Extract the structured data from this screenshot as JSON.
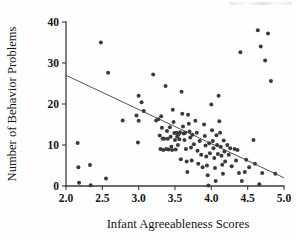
{
  "figure": {
    "type": "scatterplot",
    "caption": ""
  },
  "axes": {
    "x": {
      "title": "Infant Agreeableness Scores",
      "ticks": [
        "2.0",
        "2.5",
        "3.0",
        "3.5",
        "4.0",
        "4.5",
        "5.0"
      ],
      "min": 2.0,
      "max": 5.0
    },
    "y": {
      "title": "Number of Behavior Problems",
      "ticks": [
        "0",
        "10",
        "20",
        "30",
        "40"
      ],
      "min": 0,
      "max": 40
    }
  },
  "chart_data": {
    "type": "scatter",
    "title": "",
    "xlabel": "Infant Agreeableness Scores",
    "ylabel": "Number of Behavior Problems",
    "xlim": [
      2.0,
      5.0
    ],
    "ylim": [
      0,
      40
    ],
    "xticks": [
      2.0,
      2.5,
      3.0,
      3.5,
      4.0,
      4.5,
      5.0
    ],
    "yticks": [
      0,
      10,
      20,
      30,
      40
    ],
    "grid": false,
    "legend": null,
    "point_color": "#3b3b3f",
    "line_color": "#4a4a4a",
    "trend_line": {
      "type": "linear-regression",
      "x_start": 2.0,
      "y_start": 27.0,
      "x_end": 5.0,
      "y_end": 2.0,
      "slope": -8.33,
      "intercept": 43.67
    },
    "points": [
      [
        2.16,
        10.5
      ],
      [
        2.17,
        4.6
      ],
      [
        2.18,
        0.8
      ],
      [
        2.33,
        5.1
      ],
      [
        2.34,
        0.2
      ],
      [
        2.48,
        35.0
      ],
      [
        2.55,
        1.8
      ],
      [
        2.58,
        27.6
      ],
      [
        2.78,
        16.0
      ],
      [
        2.97,
        17.2
      ],
      [
        2.99,
        10.6
      ],
      [
        3.0,
        22.0
      ],
      [
        3.0,
        15.9
      ],
      [
        3.04,
        20.4
      ],
      [
        3.07,
        18.3
      ],
      [
        3.2,
        27.2
      ],
      [
        3.24,
        16.0
      ],
      [
        3.27,
        16.3
      ],
      [
        3.29,
        12.3
      ],
      [
        3.3,
        9.0
      ],
      [
        3.31,
        17.0
      ],
      [
        3.32,
        14.2
      ],
      [
        3.33,
        11.6
      ],
      [
        3.34,
        8.8
      ],
      [
        3.35,
        11.5
      ],
      [
        3.37,
        24.4
      ],
      [
        3.38,
        9.0
      ],
      [
        3.39,
        13.4
      ],
      [
        3.4,
        11.5
      ],
      [
        3.41,
        8.9
      ],
      [
        3.43,
        14.3
      ],
      [
        3.44,
        12.0
      ],
      [
        3.45,
        9.6
      ],
      [
        3.46,
        8.8
      ],
      [
        3.47,
        18.6
      ],
      [
        3.48,
        15.6
      ],
      [
        3.49,
        12.9
      ],
      [
        3.5,
        11.2
      ],
      [
        3.51,
        8.9
      ],
      [
        3.52,
        13.0
      ],
      [
        3.53,
        12.1
      ],
      [
        3.54,
        10.0
      ],
      [
        3.55,
        12.6
      ],
      [
        3.56,
        11.4
      ],
      [
        3.57,
        13.1
      ],
      [
        3.58,
        6.5
      ],
      [
        3.59,
        23.0
      ],
      [
        3.6,
        17.6
      ],
      [
        3.61,
        14.5
      ],
      [
        3.62,
        12.8
      ],
      [
        3.63,
        11.2
      ],
      [
        3.64,
        13.0
      ],
      [
        3.65,
        9.0
      ],
      [
        3.66,
        6.0
      ],
      [
        3.67,
        3.4
      ],
      [
        3.68,
        17.4
      ],
      [
        3.69,
        15.2
      ],
      [
        3.7,
        13.3
      ],
      [
        3.71,
        11.8
      ],
      [
        3.72,
        9.4
      ],
      [
        3.73,
        6.2
      ],
      [
        3.74,
        12.5
      ],
      [
        3.76,
        10.2
      ],
      [
        3.78,
        15.9
      ],
      [
        3.8,
        13.0
      ],
      [
        3.81,
        8.6
      ],
      [
        3.82,
        5.4
      ],
      [
        3.84,
        11.0
      ],
      [
        3.86,
        7.6
      ],
      [
        3.88,
        4.6
      ],
      [
        3.9,
        15.0
      ],
      [
        3.91,
        12.2
      ],
      [
        3.92,
        9.9
      ],
      [
        3.93,
        7.2
      ],
      [
        3.94,
        5.0
      ],
      [
        3.95,
        2.6
      ],
      [
        3.96,
        0.1
      ],
      [
        3.97,
        10.4
      ],
      [
        3.98,
        8.0
      ],
      [
        4.0,
        19.9
      ],
      [
        4.01,
        13.6
      ],
      [
        4.02,
        11.0
      ],
      [
        4.03,
        9.2
      ],
      [
        4.04,
        6.8
      ],
      [
        4.05,
        4.4
      ],
      [
        4.06,
        1.2
      ],
      [
        4.07,
        12.4
      ],
      [
        4.08,
        10.0
      ],
      [
        4.09,
        7.8
      ],
      [
        4.1,
        22.0
      ],
      [
        4.11,
        15.8
      ],
      [
        4.12,
        13.0
      ],
      [
        4.13,
        9.6
      ],
      [
        4.14,
        7.4
      ],
      [
        4.15,
        5.2
      ],
      [
        4.16,
        3.0
      ],
      [
        4.17,
        11.1
      ],
      [
        4.18,
        8.4
      ],
      [
        4.19,
        6.0
      ],
      [
        4.22,
        10.0
      ],
      [
        4.24,
        7.6
      ],
      [
        4.26,
        9.2
      ],
      [
        4.28,
        4.8
      ],
      [
        4.32,
        9.0
      ],
      [
        4.34,
        6.2
      ],
      [
        4.36,
        8.8
      ],
      [
        4.38,
        3.2
      ],
      [
        4.4,
        32.6
      ],
      [
        4.42,
        1.2
      ],
      [
        4.46,
        3.4
      ],
      [
        4.48,
        6.4
      ],
      [
        4.52,
        4.6
      ],
      [
        4.58,
        11.2
      ],
      [
        4.6,
        5.4
      ],
      [
        4.64,
        38.0
      ],
      [
        4.66,
        0.4
      ],
      [
        4.68,
        34.0
      ],
      [
        4.7,
        3.2
      ],
      [
        4.74,
        30.6
      ],
      [
        4.78,
        37.2
      ],
      [
        4.82,
        25.6
      ],
      [
        4.88,
        3.0
      ]
    ]
  }
}
